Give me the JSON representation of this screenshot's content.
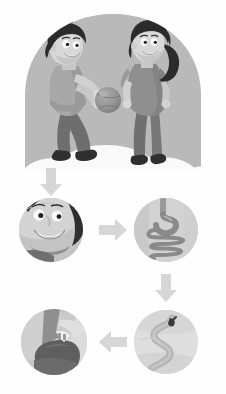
{
  "document": {
    "kind": "illustration-diagram",
    "subject": "digestive-process-flow-diagram",
    "orientation": "portrait",
    "width_px": 226,
    "height_px": 394
  },
  "palette": {
    "page_background": "#ffffff",
    "dome_background": "#b9b9b9",
    "cloud_white": "#fafafa",
    "hair_dark": "#2b2b2b",
    "skin": "#d8d8d8",
    "skin_shadow": "#c2c2c2",
    "shirt_boy": "#a8a8a8",
    "pants_boy": "#6e6e6e",
    "shirt_girl": "#8f8f8f",
    "pants_girl": "#707070",
    "ball": "#9a9a9a",
    "ball_shadow": "#7e7e7e",
    "arrow_gray": "#d6d6d6",
    "arrow_gray_dark": "#c4c4c4",
    "circle_fill_light": "#d5d5d5",
    "circle_fill_mid": "#c0c0c0",
    "organ_gray": "#8c8c8c",
    "organ_gray_dark": "#6f6f6f",
    "toilet_dark": "#5f5f5f",
    "toilet_mid": "#959595",
    "toilet_light": "#dcdcdc"
  },
  "scene_top": {
    "label": "Two children playing catch with a ball outdoors",
    "background_shape": "dome-arch",
    "ground_shape": "clouds-hills",
    "figures": [
      {
        "name": "boy",
        "label": "Boy throwing ball",
        "position": "left",
        "pose": "crouched-throwing",
        "hair": "short-dark",
        "top": "short-sleeve-shirt",
        "bottom": "long-pants",
        "holds_ball": true
      },
      {
        "name": "girl",
        "label": "Girl standing ready to catch",
        "position": "right",
        "pose": "standing",
        "hair": "dark-ponytail",
        "top": "short-sleeve-shirt",
        "bottom": "long-pants",
        "holds_ball": false
      }
    ],
    "ball": {
      "label": "Ball",
      "shape": "sphere"
    }
  },
  "flow": {
    "label": "Digestive process flow chart",
    "nodes": [
      {
        "id": "node-mouth",
        "step_number": "1",
        "label": "Mouth chewing and swallowing food",
        "icon_name": "mouth-chewing-icon",
        "position": "top-left"
      },
      {
        "id": "node-esophagus-stomach",
        "step_number": "2",
        "label": "Food travels down esophagus to stomach",
        "icon_name": "esophagus-stomach-icon",
        "position": "top-right"
      },
      {
        "id": "node-intestine",
        "step_number": "3",
        "label": "Food moves through the intestines",
        "icon_name": "intestine-icon",
        "position": "bottom-right"
      },
      {
        "id": "node-toilet",
        "step_number": "4",
        "label": "Waste is eliminated in the toilet",
        "icon_name": "toilet-icon",
        "position": "bottom-left"
      }
    ],
    "arrows": [
      {
        "id": "arrow-scene-to-mouth",
        "direction": "down",
        "icon_name": "arrow-down-icon",
        "from": "scene-top",
        "to": "node-mouth"
      },
      {
        "id": "arrow-mouth-to-stomach",
        "direction": "right",
        "icon_name": "arrow-right-icon",
        "from": "node-mouth",
        "to": "node-esophagus-stomach"
      },
      {
        "id": "arrow-stomach-to-intestine",
        "direction": "down",
        "icon_name": "arrow-down-icon",
        "from": "node-esophagus-stomach",
        "to": "node-intestine"
      },
      {
        "id": "arrow-intestine-to-toilet",
        "direction": "left",
        "icon_name": "arrow-left-icon",
        "from": "node-intestine",
        "to": "node-toilet"
      }
    ]
  }
}
